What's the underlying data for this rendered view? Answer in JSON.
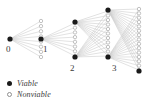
{
  "figure": {
    "name": "viable-nonviable-tree-diagram",
    "width": 146,
    "height": 108,
    "background": "#ffffff",
    "colors": {
      "edge": "#c9c9c9",
      "viable_node": "#1a1a1a",
      "nonviable_stroke": "#9a9a9a",
      "nonviable_fill": "#ffffff",
      "label_text": "#3a3a3a"
    }
  },
  "graph": {
    "node_labels": [
      {
        "id": "n0",
        "text": "0",
        "x": 6,
        "y": 52
      },
      {
        "id": "n1",
        "text": "1",
        "x": 43,
        "y": 52
      },
      {
        "id": "n2",
        "text": "2",
        "x": 70,
        "y": 71
      },
      {
        "id": "n3",
        "text": "3",
        "x": 112,
        "y": 71
      }
    ],
    "viable_nodes": [
      {
        "id": "n0",
        "x": 10,
        "y": 39,
        "r": 2.6
      },
      {
        "id": "n1",
        "x": 41,
        "y": 39,
        "r": 2.6
      },
      {
        "id": "n_apex1",
        "x": 75,
        "y": 22,
        "r": 2.6
      },
      {
        "id": "n2",
        "x": 75,
        "y": 57,
        "r": 2.6
      },
      {
        "id": "n_apex2",
        "x": 108,
        "y": 10,
        "r": 2.6
      },
      {
        "id": "n3",
        "x": 108,
        "y": 57,
        "r": 2.6
      },
      {
        "id": "n_last",
        "x": 139,
        "y": 71,
        "r": 2.6
      }
    ],
    "nonviable_columns": [
      {
        "id": "col1",
        "x": 41,
        "y_top": 21,
        "y_bottom": 57,
        "count": 8
      },
      {
        "id": "col2",
        "x": 75,
        "y_top": 23,
        "y_bottom": 56,
        "count": 8
      },
      {
        "id": "col3",
        "x": 108,
        "y_top": 11,
        "y_bottom": 56,
        "count": 11
      },
      {
        "id": "col4",
        "x": 139,
        "y_top": 9,
        "y_bottom": 70,
        "count": 15
      }
    ]
  },
  "legend": {
    "items": [
      {
        "marker": "filled-dot-icon",
        "label": "Viable"
      },
      {
        "marker": "open-circle-icon",
        "label": "Nonviable"
      }
    ]
  }
}
